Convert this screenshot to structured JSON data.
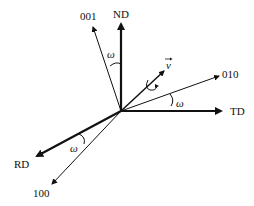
{
  "diagram": {
    "title": "",
    "origin": [
      121,
      111
    ],
    "axes": [
      {
        "id": "nd",
        "label": "ND",
        "end": [
          121,
          21
        ],
        "weight": "thick",
        "label_pos": [
          121,
          15
        ]
      },
      {
        "id": "td",
        "label": "TD",
        "end": [
          224,
          111
        ],
        "weight": "thick",
        "label_pos": [
          238,
          115
        ]
      },
      {
        "id": "rd",
        "label": "RD",
        "end": [
          34,
          157
        ],
        "weight": "thick",
        "label_pos": [
          22,
          168
        ]
      },
      {
        "id": "dir001",
        "label": "001",
        "end": [
          93,
          26
        ],
        "weight": "thin",
        "label_pos": [
          88,
          18
        ]
      },
      {
        "id": "dir010",
        "label": "010",
        "end": [
          220,
          76
        ],
        "weight": "thin",
        "label_pos": [
          230,
          78
        ]
      },
      {
        "id": "dir100",
        "label": "100",
        "end": [
          51,
          185
        ],
        "weight": "thin",
        "label_pos": [
          42,
          196
        ]
      },
      {
        "id": "v",
        "label": "v",
        "end": [
          165,
          70
        ],
        "weight": "medium",
        "label_pos": [
          169,
          67
        ]
      }
    ],
    "angle_labels": [
      {
        "label": "ω",
        "between": [
          "ND",
          "001"
        ],
        "pos": [
          111,
          56
        ]
      },
      {
        "label": "ω",
        "between": [
          "TD",
          "010"
        ],
        "pos": [
          180,
          105
        ]
      },
      {
        "label": "ω",
        "between": [
          "RD",
          "100"
        ],
        "pos": [
          76,
          148
        ]
      }
    ],
    "rotation_symbol": {
      "around": "v",
      "pos": [
        151,
        84
      ]
    }
  }
}
